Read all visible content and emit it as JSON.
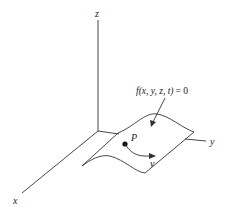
{
  "diagram": {
    "type": "3d-surface-sketch",
    "axes": {
      "z_label": "z",
      "x_label": "x",
      "y_label": "y"
    },
    "surface_equation": {
      "func": "f",
      "args": "(x, y, z, t)",
      "rhs": "= 0",
      "full": "f(x, y, z, t) = 0"
    },
    "point_label": "P",
    "velocity_label": "v",
    "colors": {
      "stroke": "#333333",
      "text": "#222222",
      "background": "#ffffff"
    }
  }
}
